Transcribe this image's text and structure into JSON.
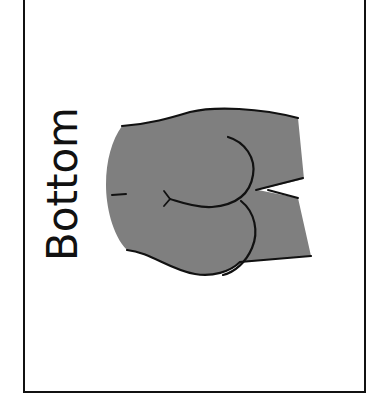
{
  "card": {
    "label": "Bottom",
    "border_color": "#111111",
    "background_color": "#ffffff"
  },
  "illustration": {
    "subject": "buttocks-drawing",
    "fill_color": "#7f7f7f",
    "stroke_color": "#111111"
  }
}
